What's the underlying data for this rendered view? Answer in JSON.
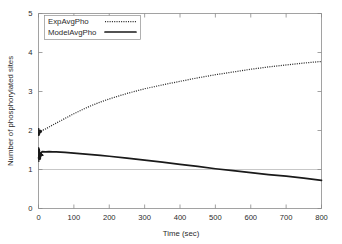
{
  "chart_data": {
    "type": "line",
    "title": "",
    "xlabel": "Time (sec)",
    "ylabel": "Number of phosphorylated sites",
    "xlim": [
      0,
      800
    ],
    "ylim": [
      0,
      5
    ],
    "xticks": [
      0,
      100,
      200,
      300,
      400,
      500,
      600,
      700,
      800
    ],
    "yticks": [
      0,
      1,
      2,
      3,
      4,
      5
    ],
    "grid": false,
    "reference_lines": [
      {
        "axis": "y",
        "value": 1,
        "color": "#b9b9b9"
      }
    ],
    "legend_position": "top-left-inside",
    "x": [
      0,
      10,
      20,
      30,
      40,
      50,
      75,
      100,
      125,
      150,
      175,
      200,
      250,
      300,
      350,
      400,
      450,
      500,
      550,
      600,
      650,
      700,
      750,
      800
    ],
    "series": [
      {
        "name": "ExpAvgPho",
        "style": "dotted",
        "color": "#2a2a2a",
        "values": [
          1.98,
          2.0,
          2.04,
          2.09,
          2.14,
          2.19,
          2.31,
          2.43,
          2.54,
          2.64,
          2.73,
          2.81,
          2.95,
          3.07,
          3.17,
          3.26,
          3.35,
          3.43,
          3.5,
          3.57,
          3.63,
          3.68,
          3.73,
          3.77
        ]
      },
      {
        "name": "ModelAvgPho",
        "style": "solid",
        "color": "#1a1a1a",
        "values": [
          1.3,
          1.46,
          1.45,
          1.46,
          1.45,
          1.45,
          1.44,
          1.42,
          1.4,
          1.38,
          1.36,
          1.34,
          1.29,
          1.24,
          1.19,
          1.13,
          1.08,
          1.02,
          0.97,
          0.92,
          0.87,
          0.83,
          0.78,
          0.72
        ]
      }
    ],
    "annotations": [
      {
        "name": "initial-oscillation",
        "series": "ModelAvgPho",
        "x_range": [
          0,
          14
        ],
        "y_range": [
          1.22,
          1.52
        ],
        "note": "rapid transient oscillation at start"
      },
      {
        "name": "initial-oscillation-exp",
        "series": "ExpAvgPho",
        "x_range": [
          0,
          10
        ],
        "y_range": [
          1.88,
          2.06
        ],
        "note": "small transient spike at start"
      }
    ]
  },
  "legend": {
    "entries": [
      {
        "label": "ExpAvgPho",
        "style": "dotted"
      },
      {
        "label": "ModelAvgPho",
        "style": "solid"
      }
    ]
  },
  "axes": {
    "x_title": "Time (sec)",
    "y_title": "Number of phosphorylated sites",
    "x_tick_labels": [
      "0",
      "100",
      "200",
      "300",
      "400",
      "500",
      "600",
      "700",
      "800"
    ],
    "y_tick_labels": [
      "0",
      "1",
      "2",
      "3",
      "4",
      "5"
    ]
  },
  "colors": {
    "background": "#ffffff",
    "axis": "#8a8a8a",
    "text": "#2b2b2b",
    "exp_series": "#2a2a2a",
    "model_series": "#1a1a1a",
    "reference_line": "#b9b9b9"
  }
}
